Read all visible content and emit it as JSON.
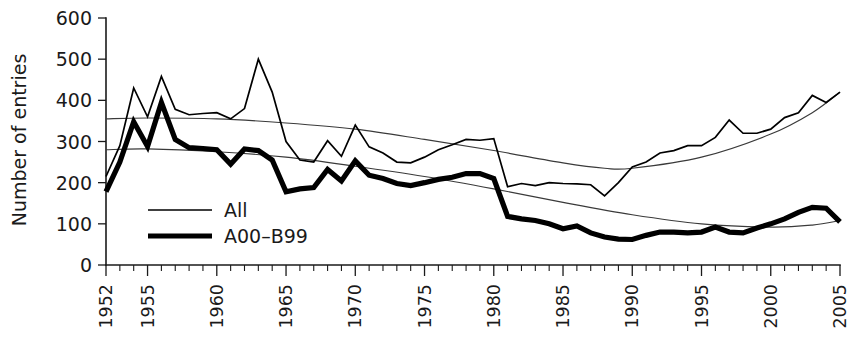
{
  "chart_data": {
    "type": "line",
    "title": "",
    "xlabel": "",
    "ylabel": "Number of entries",
    "xlim": [
      1952,
      2005
    ],
    "ylim": [
      0,
      600
    ],
    "grid": false,
    "legend_position": "inside-left",
    "y_ticks": [
      0,
      100,
      200,
      300,
      400,
      500,
      600
    ],
    "x_ticks_labeled": [
      1952,
      1955,
      1960,
      1965,
      1970,
      1975,
      1980,
      1985,
      1990,
      1995,
      2000,
      2005
    ],
    "x_tick_step_minor": 1,
    "x": [
      1952,
      1953,
      1954,
      1955,
      1956,
      1957,
      1958,
      1959,
      1960,
      1961,
      1962,
      1963,
      1964,
      1965,
      1966,
      1967,
      1968,
      1969,
      1970,
      1971,
      1972,
      1973,
      1974,
      1975,
      1976,
      1977,
      1978,
      1979,
      1980,
      1981,
      1982,
      1983,
      1984,
      1985,
      1986,
      1987,
      1988,
      1989,
      1990,
      1991,
      1992,
      1993,
      1994,
      1995,
      1996,
      1997,
      1998,
      1999,
      2000,
      2001,
      2002,
      2003,
      2004,
      2005
    ],
    "series": [
      {
        "name": "All",
        "line_style": "thin",
        "color": "#000000",
        "values": [
          215,
          290,
          430,
          360,
          458,
          378,
          365,
          368,
          370,
          355,
          380,
          500,
          420,
          300,
          255,
          250,
          302,
          264,
          340,
          287,
          272,
          250,
          248,
          262,
          280,
          292,
          305,
          303,
          307,
          190,
          198,
          193,
          200,
          198,
          197,
          195,
          168,
          200,
          238,
          250,
          272,
          278,
          290,
          290,
          310,
          352,
          320,
          320,
          330,
          358,
          370,
          412,
          395,
          420
        ]
      },
      {
        "name": "A00–B99",
        "line_style": "thick",
        "color": "#000000",
        "values": [
          178,
          250,
          348,
          288,
          395,
          305,
          285,
          283,
          280,
          245,
          282,
          278,
          255,
          178,
          185,
          188,
          232,
          204,
          253,
          218,
          210,
          198,
          193,
          200,
          208,
          213,
          222,
          222,
          210,
          118,
          112,
          108,
          100,
          88,
          95,
          78,
          68,
          63,
          62,
          72,
          80,
          80,
          78,
          80,
          92,
          80,
          78,
          90,
          100,
          112,
          128,
          140,
          138,
          105
        ]
      }
    ],
    "trend_lines": [
      {
        "name": "All trend",
        "type": "smoothed",
        "points": [
          [
            1952,
            355
          ],
          [
            1955,
            357
          ],
          [
            1960,
            355
          ],
          [
            1965,
            345
          ],
          [
            1970,
            330
          ],
          [
            1975,
            305
          ],
          [
            1980,
            278
          ],
          [
            1985,
            248
          ],
          [
            1988,
            235
          ],
          [
            1990,
            235
          ],
          [
            1995,
            262
          ],
          [
            2000,
            318
          ],
          [
            2003,
            370
          ],
          [
            2005,
            420
          ]
        ]
      },
      {
        "name": "A00-B99 trend",
        "type": "smoothed",
        "points": [
          [
            1952,
            280
          ],
          [
            1955,
            282
          ],
          [
            1960,
            275
          ],
          [
            1965,
            262
          ],
          [
            1970,
            240
          ],
          [
            1975,
            215
          ],
          [
            1980,
            185
          ],
          [
            1985,
            152
          ],
          [
            1990,
            122
          ],
          [
            1995,
            100
          ],
          [
            2000,
            92
          ],
          [
            2003,
            97
          ],
          [
            2005,
            108
          ]
        ]
      }
    ]
  },
  "legend": {
    "entries": [
      {
        "label": "All",
        "style": "thin"
      },
      {
        "label": "A00–B99",
        "style": "thick"
      }
    ]
  },
  "axes": {
    "y_title": "Number of entries"
  }
}
